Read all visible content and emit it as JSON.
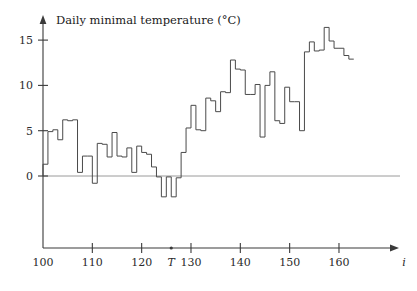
{
  "chart_data": {
    "type": "line",
    "subtype": "step-post",
    "title": "Daily minimal temperature (°C)",
    "xlabel": "i",
    "ylabel": "",
    "xlim": [
      100,
      162
    ],
    "ylim": [
      -3.6,
      17.2
    ],
    "grid": false,
    "legend": null,
    "x_ticks": [
      100,
      110,
      120,
      130,
      140,
      150,
      160
    ],
    "x_tick_labels": [
      "100",
      "110",
      "120",
      "130",
      "140",
      "150",
      "160"
    ],
    "y_ticks": [
      0,
      5,
      10,
      15
    ],
    "y_tick_labels": [
      "0",
      "5",
      "10",
      "15"
    ],
    "annotations": [
      {
        "label": "T",
        "x": 126,
        "kind": "x-axis-marker"
      }
    ],
    "x": [
      100,
      101,
      102,
      103,
      104,
      105,
      106,
      107,
      108,
      109,
      110,
      111,
      112,
      113,
      114,
      115,
      116,
      117,
      118,
      119,
      120,
      121,
      122,
      123,
      124,
      125,
      126,
      127,
      128,
      129,
      130,
      131,
      132,
      133,
      134,
      135,
      136,
      137,
      138,
      139,
      140,
      141,
      142,
      143,
      144,
      145,
      146,
      147,
      148,
      149,
      150,
      151,
      152,
      153,
      154,
      155,
      156,
      157,
      158,
      159,
      160,
      161,
      162
    ],
    "values": [
      1.3,
      4.9,
      5.1,
      4.0,
      6.2,
      6.1,
      6.2,
      0.4,
      2.2,
      2.2,
      -0.8,
      3.6,
      3.5,
      2.1,
      4.8,
      2.2,
      2.1,
      3.1,
      0.4,
      3.3,
      2.6,
      2.4,
      1.0,
      -0.1,
      -2.3,
      -0.1,
      -2.3,
      -0.2,
      2.6,
      5.3,
      7.8,
      5.1,
      5.0,
      8.6,
      8.3,
      7.1,
      9.3,
      9.2,
      12.8,
      11.8,
      11.7,
      9.0,
      9.0,
      10.1,
      4.3,
      10.0,
      11.5,
      6.1,
      5.8,
      9.8,
      8.2,
      8.2,
      5.0,
      13.7,
      14.8,
      13.8,
      13.9,
      16.4,
      14.9,
      14.1,
      14.1,
      13.3,
      12.9
    ],
    "series": [
      {
        "name": "Daily minimal temperature",
        "color": "#4a4a4a",
        "values": [
          1.3,
          4.9,
          5.1,
          4.0,
          6.2,
          6.1,
          6.2,
          0.4,
          2.2,
          2.2,
          -0.8,
          3.6,
          3.5,
          2.1,
          4.8,
          2.2,
          2.1,
          3.1,
          0.4,
          3.3,
          2.6,
          2.4,
          1.0,
          -0.1,
          -2.3,
          -0.1,
          -2.3,
          -0.2,
          2.6,
          5.3,
          7.8,
          5.1,
          5.0,
          8.6,
          8.3,
          7.1,
          9.3,
          9.2,
          12.8,
          11.8,
          11.7,
          9.0,
          9.0,
          10.1,
          4.3,
          10.0,
          11.5,
          6.1,
          5.8,
          9.8,
          8.2,
          8.2,
          5.0,
          13.7,
          14.8,
          13.8,
          13.9,
          16.4,
          14.9,
          14.1,
          14.1,
          13.3,
          12.9
        ]
      }
    ]
  },
  "figure": {
    "title": "Daily minimal temperature (°C)",
    "x_axis_name": "i",
    "t_marker": "T",
    "axis_color": "#3a3a3a",
    "series_color": "#4a4a4a",
    "zero_line_color": "#9a9a9a",
    "background": "#ffffff"
  }
}
